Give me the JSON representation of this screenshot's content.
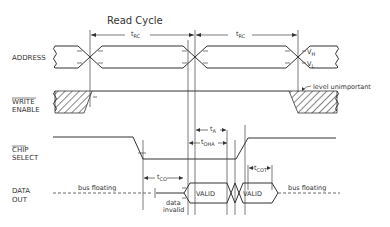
{
  "title": "Read Cycle",
  "signals": {
    "address": "ADDRESS",
    "write_enable_1": "WRITE",
    "write_enable_2": "ENABLE",
    "chip_select_1": "CHIP",
    "chip_select_2": "SELECT",
    "data_out_1": "DATA",
    "data_out_2": "OUT"
  },
  "timings": {
    "t_rc": "t",
    "t_rc_sub": "RC",
    "t_a": "t",
    "t_a_sub": "A",
    "t_oha": "t",
    "t_oha_sub": "OHA",
    "t_co": "t",
    "t_co_sub": "CO",
    "t_cot": "t",
    "t_cot_sub": "COT"
  },
  "levels": {
    "vh": "V",
    "vh_sub": "H",
    "vl": "V",
    "vl_sub": "L"
  },
  "annotations": {
    "level_unimportant": "level unimportant",
    "bus_floating": "bus floating",
    "data": "data",
    "invalid": "invalid",
    "valid": "VALID"
  }
}
